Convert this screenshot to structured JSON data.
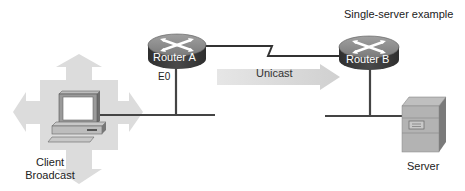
{
  "title": "Single-server example",
  "nodes": {
    "router_a": {
      "label": "Router A",
      "interface": "E0"
    },
    "router_b": {
      "label": "Router B"
    },
    "client": {
      "label_line1": "Client",
      "label_line2": "Broadcast"
    },
    "server": {
      "label": "Server"
    }
  },
  "links": {
    "unicast": {
      "label": "Unicast"
    }
  },
  "colors": {
    "router_top": "#8a8a8a",
    "router_side": "#3a3a3a",
    "arrow_fill": "#d9d9d9",
    "broadcast_fill": "#dcdcdc",
    "line": "#444444"
  }
}
